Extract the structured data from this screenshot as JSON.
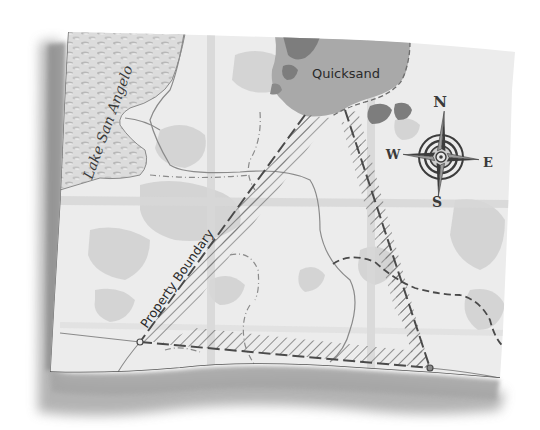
{
  "figure": {
    "type": "illustrated-map",
    "style": "grayscale curled paper map"
  },
  "labels": {
    "lake": "Lake San Angelo",
    "quicksand": "Quicksand",
    "boundary": "Property Boundary"
  },
  "compass": {
    "north": "N",
    "south": "S",
    "east": "E",
    "west": "W"
  },
  "colors": {
    "paper": "#ececec",
    "paper_shadow": "#9a9a9a",
    "lake_fill": "#d4d4d4",
    "quicksand_fill": "#a9a9a9",
    "dark_patch": "#7d7d7d",
    "terrain_patch": "#cfcfcf",
    "boundary_line": "#4a4a4a",
    "hatch": "#6a6a6a",
    "trail": "#8a8a8a",
    "compass_dark": "#3c3c3c"
  },
  "property_triangle": {
    "vertices": [
      [
        305,
        115
      ],
      [
        345,
        110
      ],
      [
        430,
        368
      ],
      [
        140,
        342
      ]
    ],
    "description": "Hatched property area bounded by dashed lines"
  }
}
